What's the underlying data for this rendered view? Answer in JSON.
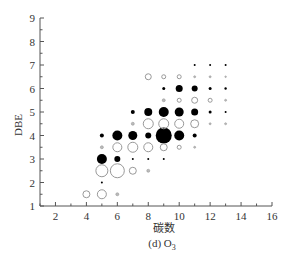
{
  "chart_data": {
    "type": "scatter",
    "subtype": "bubble",
    "title": "",
    "caption": "(d) O3",
    "xlabel": "碳数",
    "ylabel": "DBE",
    "xlim": [
      1,
      16
    ],
    "ylim": [
      1,
      9
    ],
    "xticks": [
      2,
      4,
      6,
      8,
      10,
      12,
      14,
      16
    ],
    "yticks": [
      1,
      2,
      3,
      4,
      5,
      6,
      7,
      8,
      9
    ],
    "grid": false,
    "legend": null,
    "series": [
      {
        "name": "filled (integer DBE)",
        "style": "filled",
        "color": "#000000",
        "points": [
          {
            "x": 5,
            "y": 2,
            "r": 1
          },
          {
            "x": 5,
            "y": 3,
            "r": 5
          },
          {
            "x": 6,
            "y": 3,
            "r": 3
          },
          {
            "x": 7,
            "y": 3,
            "r": 1
          },
          {
            "x": 8,
            "y": 3,
            "r": 1
          },
          {
            "x": 9,
            "y": 3,
            "r": 1
          },
          {
            "x": 5,
            "y": 4,
            "r": 2
          },
          {
            "x": 6,
            "y": 4,
            "r": 5
          },
          {
            "x": 7,
            "y": 4,
            "r": 4.5
          },
          {
            "x": 8,
            "y": 4,
            "r": 3
          },
          {
            "x": 9,
            "y": 4,
            "r": 8
          },
          {
            "x": 10,
            "y": 4,
            "r": 5
          },
          {
            "x": 11,
            "y": 4,
            "r": 2
          },
          {
            "x": 7,
            "y": 5,
            "r": 2
          },
          {
            "x": 8,
            "y": 5,
            "r": 4
          },
          {
            "x": 9,
            "y": 5,
            "r": 5
          },
          {
            "x": 10,
            "y": 5,
            "r": 4.5
          },
          {
            "x": 11,
            "y": 5,
            "r": 3.5
          },
          {
            "x": 12,
            "y": 5,
            "r": 1.5
          },
          {
            "x": 13,
            "y": 5,
            "r": 1
          },
          {
            "x": 9,
            "y": 6,
            "r": 1.5
          },
          {
            "x": 10,
            "y": 6,
            "r": 3.5
          },
          {
            "x": 11,
            "y": 6,
            "r": 3
          },
          {
            "x": 12,
            "y": 6,
            "r": 1.5
          },
          {
            "x": 13,
            "y": 6,
            "r": 1.2
          },
          {
            "x": 11,
            "y": 7,
            "r": 1
          },
          {
            "x": 12,
            "y": 7,
            "r": 1
          },
          {
            "x": 13,
            "y": 7,
            "r": 1
          }
        ]
      },
      {
        "name": "open (half-integer DBE)",
        "style": "open",
        "color": "#999999",
        "points": [
          {
            "x": 4,
            "y": 1.5,
            "r": 3.5
          },
          {
            "x": 5,
            "y": 1.5,
            "r": 4.5
          },
          {
            "x": 6,
            "y": 1.5,
            "r": 1.5
          },
          {
            "x": 5,
            "y": 2.5,
            "r": 6
          },
          {
            "x": 6,
            "y": 2.5,
            "r": 7
          },
          {
            "x": 7,
            "y": 2.5,
            "r": 3.5
          },
          {
            "x": 8,
            "y": 2.5,
            "r": 1.5
          },
          {
            "x": 5,
            "y": 3.5,
            "r": 1.5
          },
          {
            "x": 6,
            "y": 3.5,
            "r": 4.5
          },
          {
            "x": 7,
            "y": 3.5,
            "r": 5
          },
          {
            "x": 8,
            "y": 3.5,
            "r": 4.5
          },
          {
            "x": 9,
            "y": 3.5,
            "r": 3.5
          },
          {
            "x": 10,
            "y": 3.5,
            "r": 2
          },
          {
            "x": 11,
            "y": 3.5,
            "r": 1
          },
          {
            "x": 7,
            "y": 4.5,
            "r": 1.5
          },
          {
            "x": 8,
            "y": 4.5,
            "r": 5
          },
          {
            "x": 9,
            "y": 4.5,
            "r": 5
          },
          {
            "x": 10,
            "y": 4.5,
            "r": 4.5
          },
          {
            "x": 11,
            "y": 4.5,
            "r": 4
          },
          {
            "x": 12,
            "y": 4.5,
            "r": 1
          },
          {
            "x": 13,
            "y": 4.5,
            "r": 1
          },
          {
            "x": 9,
            "y": 5.5,
            "r": 1.5
          },
          {
            "x": 10,
            "y": 5.5,
            "r": 2
          },
          {
            "x": 11,
            "y": 5.5,
            "r": 3
          },
          {
            "x": 12,
            "y": 5.5,
            "r": 2
          },
          {
            "x": 13,
            "y": 5.5,
            "r": 1
          },
          {
            "x": 8,
            "y": 6.5,
            "r": 3
          },
          {
            "x": 9,
            "y": 6.5,
            "r": 2
          },
          {
            "x": 10,
            "y": 6.5,
            "r": 2
          },
          {
            "x": 11,
            "y": 6.5,
            "r": 1
          },
          {
            "x": 12,
            "y": 6.5,
            "r": 1
          },
          {
            "x": 13,
            "y": 6.5,
            "r": 0.8
          }
        ]
      }
    ]
  },
  "labels": {
    "ylabel": "DBE",
    "xlabel": "碳数",
    "caption_main": "(d) O",
    "caption_sub": "3"
  }
}
